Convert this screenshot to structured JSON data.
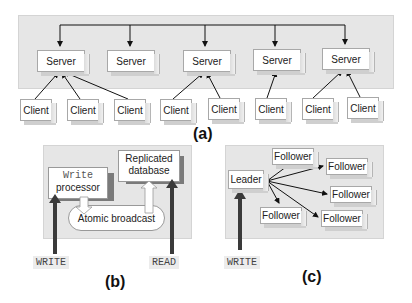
{
  "panel_a": {
    "caption": "(a)",
    "servers": [
      {
        "label": "Server"
      },
      {
        "label": "Server"
      },
      {
        "label": "Server"
      },
      {
        "label": "Server"
      },
      {
        "label": "Server"
      }
    ],
    "clients": [
      {
        "label": "Client"
      },
      {
        "label": "Client"
      },
      {
        "label": "Client"
      },
      {
        "label": "Client"
      },
      {
        "label": "Client"
      },
      {
        "label": "Client"
      },
      {
        "label": "Client"
      },
      {
        "label": "Client"
      }
    ]
  },
  "panel_b": {
    "caption": "(b)",
    "write_processor": {
      "line1": "Write",
      "line2": "processor"
    },
    "replicated_database": {
      "line1": "Replicated",
      "line2": "database"
    },
    "atomic_broadcast": "Atomic broadcast",
    "write_label": "WRITE",
    "read_label": "READ"
  },
  "panel_c": {
    "caption": "(c)",
    "leader": "Leader",
    "followers": [
      {
        "label": "Follower"
      },
      {
        "label": "Follower"
      },
      {
        "label": "Follower"
      },
      {
        "label": "Follower"
      },
      {
        "label": "Follower"
      }
    ],
    "write_label": "WRITE"
  }
}
